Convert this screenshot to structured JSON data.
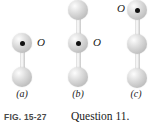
{
  "figure": {
    "fig_number": "FIG. 15-27",
    "caption": "Question 11.",
    "pivot_label": "O",
    "colors": {
      "sphere_light": "#fdfdfd",
      "sphere_mid": "#dcdcdc",
      "sphere_dark": "#ababab",
      "rod": "#efefef",
      "pivot_dot": "#111111",
      "text": "#1a1a1a",
      "fig_number_text": "#4a4a4a",
      "background": "#ffffff"
    },
    "panels": [
      {
        "letter": "(a)",
        "ball_count": 2,
        "pivot_index": 0,
        "pivot_label": "O",
        "pivot_label_side": "right",
        "balls": [
          {
            "cx": 22,
            "cy": 43,
            "r": 10,
            "is_pivot": true
          },
          {
            "cx": 22,
            "cy": 77,
            "r": 10,
            "is_pivot": false
          }
        ],
        "rods": [
          {
            "x": 22,
            "y1": 43,
            "y2": 77
          }
        ],
        "o_label": {
          "x": 37,
          "y": 37
        },
        "letter_x": 10
      },
      {
        "letter": "(b)",
        "ball_count": 3,
        "pivot_index": 1,
        "pivot_label": "O",
        "pivot_label_side": "right",
        "balls": [
          {
            "cx": 78,
            "cy": 10,
            "r": 10,
            "is_pivot": false
          },
          {
            "cx": 78,
            "cy": 43,
            "r": 10,
            "is_pivot": true
          },
          {
            "cx": 78,
            "cy": 77,
            "r": 10,
            "is_pivot": false
          }
        ],
        "rods": [
          {
            "x": 78,
            "y1": 10,
            "y2": 43
          },
          {
            "x": 78,
            "y1": 43,
            "y2": 77
          }
        ],
        "o_label": {
          "x": 93,
          "y": 37
        },
        "letter_x": 65
      },
      {
        "letter": "(c)",
        "ball_count": 3,
        "pivot_index": 0,
        "pivot_label": "O",
        "pivot_label_side": "left",
        "balls": [
          {
            "cx": 137,
            "cy": 10,
            "r": 10,
            "is_pivot": true
          },
          {
            "cx": 137,
            "cy": 44,
            "r": 10,
            "is_pivot": false
          },
          {
            "cx": 137,
            "cy": 78,
            "r": 10,
            "is_pivot": false
          }
        ],
        "rods": [
          {
            "x": 137,
            "y1": 10,
            "y2": 44
          },
          {
            "x": 137,
            "y1": 44,
            "y2": 78
          }
        ],
        "o_label": {
          "x": 119,
          "y": 4
        },
        "letter_x": 123
      }
    ]
  }
}
